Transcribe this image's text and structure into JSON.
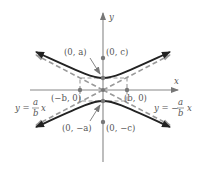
{
  "diagram": {
    "type": "hyperbola-vertical-transverse-axis",
    "axes": {
      "x_label": "x",
      "y_label": "y"
    },
    "points": {
      "vertex_top": "(0, a)",
      "vertex_bottom": "(0, −a)",
      "focus_top": "(0, c)",
      "focus_bottom": "(0, −c)",
      "co_vertex_left": "(−b, 0)",
      "co_vertex_right": "(b, 0)"
    },
    "asymptotes": {
      "left_label": "y = (a/b) x",
      "right_label": "y = −(a/b) x",
      "left_parts": {
        "lhs": "y =",
        "num": "a",
        "den": "b",
        "var": "x"
      },
      "right_parts": {
        "lhs": "y = −",
        "num": "a",
        "den": "b",
        "var": "x"
      }
    },
    "colors": {
      "curve": "#222222",
      "axis": "#888888",
      "asymptote": "#999999",
      "point": "#777777",
      "label": "#555555"
    }
  }
}
